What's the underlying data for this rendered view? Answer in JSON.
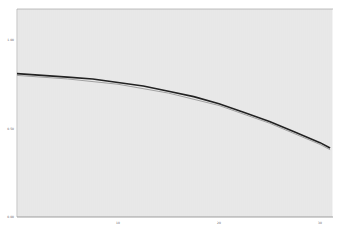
{
  "chart_data": {
    "type": "line",
    "title": "",
    "xlabel": "",
    "ylabel": "",
    "xlim": [
      0,
      31.5
    ],
    "ylim": [
      0,
      1.2
    ],
    "x_ticks": [
      "10",
      "20",
      "30"
    ],
    "y_ticks": [
      "0.00",
      "0.50",
      "1.00"
    ],
    "grid": true,
    "legend": null,
    "series": [
      {
        "name": "primary",
        "color": "#222222",
        "x": [
          0,
          2.5,
          5,
          7.5,
          10,
          12.5,
          15,
          17.5,
          20,
          22.5,
          25,
          27.5,
          30,
          31
        ],
        "values": [
          0.81,
          0.8,
          0.79,
          0.78,
          0.76,
          0.74,
          0.71,
          0.68,
          0.64,
          0.59,
          0.54,
          0.48,
          0.42,
          0.39
        ]
      },
      {
        "name": "secondary",
        "color": "#999999",
        "x": [
          0,
          5,
          10,
          15,
          20,
          25,
          30,
          31
        ],
        "values": [
          0.8,
          0.78,
          0.75,
          0.7,
          0.63,
          0.53,
          0.41,
          0.38
        ]
      }
    ]
  },
  "colors": {
    "background": "#ffffff",
    "grid": "#bbbbbb",
    "axis": "#888888"
  }
}
